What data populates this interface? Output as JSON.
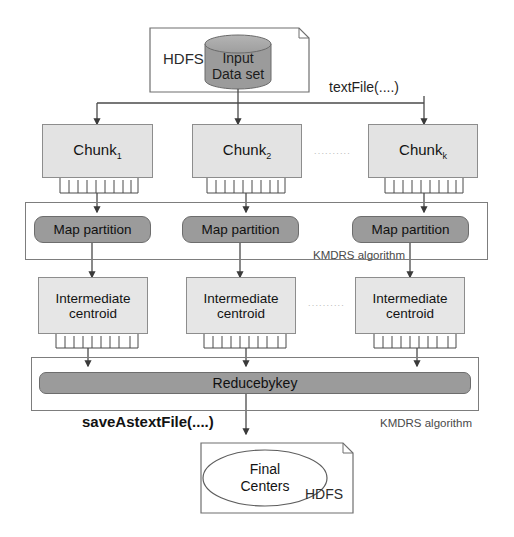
{
  "diagram": {
    "colors": {
      "chunk_fill": "#e3e3e3",
      "intermediate_fill": "#e6e6e6",
      "dark_fill": "#9b9b9b",
      "cylinder_fill": "#9b9b9b",
      "stroke": "#8d8d8d",
      "label_gray": "#4a4a4a"
    },
    "source": {
      "store_label": "HDFS",
      "dataset_line1": "Input",
      "dataset_line2": "Data set",
      "dataset_label": "Input Data set",
      "shape": "cylinder"
    },
    "operations": {
      "read": "textFile(....)",
      "write": "saveAstextFile(....)"
    },
    "chunks": [
      {
        "name": "Chunk",
        "subscript": "1"
      },
      {
        "name": "Chunk",
        "subscript": "2"
      },
      {
        "name": "Chunk",
        "subscript": "k"
      }
    ],
    "chunk_ellipsis": "..........",
    "map_partitions": [
      {
        "label": "Map partition"
      },
      {
        "label": "Map partition"
      },
      {
        "label": "Map partition"
      }
    ],
    "intermediate_centroids": [
      {
        "line1": "Intermediate",
        "line2": "centroid"
      },
      {
        "line1": "Intermediate",
        "line2": "centroid"
      },
      {
        "line1": "Intermediate",
        "line2": "centroid"
      }
    ],
    "centroid_ellipsis": "..........",
    "reduce": {
      "label": "Reducebykey"
    },
    "algorithm_labels": [
      {
        "text": "KMDRS algorithm"
      },
      {
        "text": "KMDRS algorithm"
      }
    ],
    "sink": {
      "line1": "Final",
      "line2": "Centers",
      "label": "Final Centers",
      "store_label": "HDFS",
      "shape": "ellipse"
    }
  }
}
